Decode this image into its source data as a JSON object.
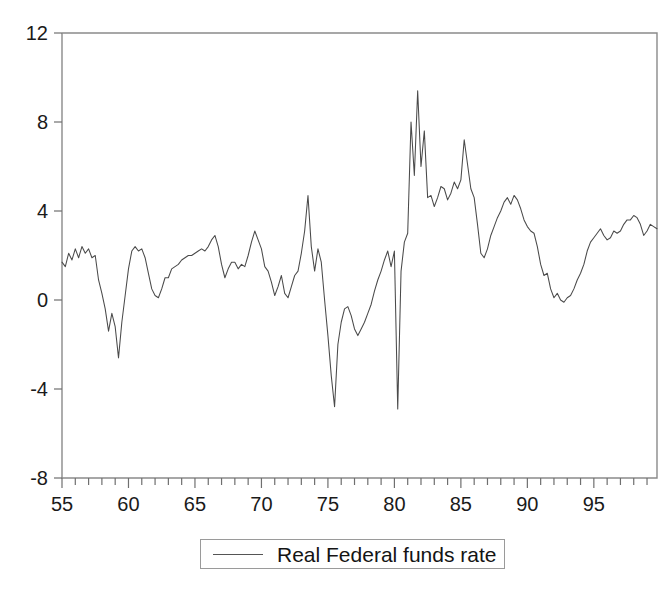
{
  "figure": {
    "background": "#ffffff",
    "line_color": "#4a4a4a",
    "axis_color": "#8a8a8a"
  },
  "legend": {
    "label": "Real Federal funds rate",
    "swatch_name": "line-swatch",
    "position": "bottom-center",
    "border_color": "#9a9a9a"
  },
  "axes": {
    "y_ticks": [
      "12",
      "8",
      "4",
      "0",
      "-4",
      "-8"
    ],
    "y_tick_values": [
      12,
      8,
      4,
      0,
      -4,
      -8
    ],
    "x_ticks": [
      "55",
      "60",
      "65",
      "70",
      "75",
      "80",
      "85",
      "90",
      "95"
    ],
    "x_tick_values": [
      55,
      60,
      65,
      70,
      75,
      80,
      85,
      90,
      95
    ],
    "x_minor_step": 1,
    "grid": false
  },
  "chart_data": {
    "type": "line",
    "title": "",
    "subtitle": "",
    "xlabel": "",
    "ylabel": "",
    "xlim": [
      1955.0,
      1999.75
    ],
    "ylim": [
      -8,
      12
    ],
    "grid": false,
    "legend_position": "bottom-center",
    "series": [
      {
        "name": "Real Federal funds rate",
        "color": "#4a4a4a",
        "x": [
          1955.0,
          1955.25,
          1955.5,
          1955.75,
          1956.0,
          1956.25,
          1956.5,
          1956.75,
          1957.0,
          1957.25,
          1957.5,
          1957.75,
          1958.0,
          1958.25,
          1958.5,
          1958.75,
          1959.0,
          1959.25,
          1959.5,
          1959.75,
          1960.0,
          1960.25,
          1960.5,
          1960.75,
          1961.0,
          1961.25,
          1961.5,
          1961.75,
          1962.0,
          1962.25,
          1962.5,
          1962.75,
          1963.0,
          1963.25,
          1963.5,
          1963.75,
          1964.0,
          1964.25,
          1964.5,
          1964.75,
          1965.0,
          1965.25,
          1965.5,
          1965.75,
          1966.0,
          1966.25,
          1966.5,
          1966.75,
          1967.0,
          1967.25,
          1967.5,
          1967.75,
          1968.0,
          1968.25,
          1968.5,
          1968.75,
          1969.0,
          1969.25,
          1969.5,
          1969.75,
          1970.0,
          1970.25,
          1970.5,
          1970.75,
          1971.0,
          1971.25,
          1971.5,
          1971.75,
          1972.0,
          1972.25,
          1972.5,
          1972.75,
          1973.0,
          1973.25,
          1973.5,
          1973.75,
          1974.0,
          1974.25,
          1974.5,
          1974.75,
          1975.0,
          1975.25,
          1975.5,
          1975.75,
          1976.0,
          1976.25,
          1976.5,
          1976.75,
          1977.0,
          1977.25,
          1977.5,
          1977.75,
          1978.0,
          1978.25,
          1978.5,
          1978.75,
          1979.0,
          1979.25,
          1979.5,
          1979.75,
          1980.0,
          1980.25,
          1980.5,
          1980.75,
          1981.0,
          1981.25,
          1981.5,
          1981.75,
          1982.0,
          1982.25,
          1982.5,
          1982.75,
          1983.0,
          1983.25,
          1983.5,
          1983.75,
          1984.0,
          1984.25,
          1984.5,
          1984.75,
          1985.0,
          1985.25,
          1985.5,
          1985.75,
          1986.0,
          1986.25,
          1986.5,
          1986.75,
          1987.0,
          1987.25,
          1987.5,
          1987.75,
          1988.0,
          1988.25,
          1988.5,
          1988.75,
          1989.0,
          1989.25,
          1989.5,
          1989.75,
          1990.0,
          1990.25,
          1990.5,
          1990.75,
          1991.0,
          1991.25,
          1991.5,
          1991.75,
          1992.0,
          1992.25,
          1992.5,
          1992.75,
          1993.0,
          1993.25,
          1993.5,
          1993.75,
          1994.0,
          1994.25,
          1994.5,
          1994.75,
          1995.0,
          1995.25,
          1995.5,
          1995.75,
          1996.0,
          1996.25,
          1996.5,
          1996.75,
          1997.0,
          1997.25,
          1997.5,
          1997.75,
          1998.0,
          1998.25,
          1998.5,
          1998.75,
          1999.0,
          1999.25,
          1999.5,
          1999.75
        ],
        "y": [
          1.7,
          1.5,
          2.1,
          1.8,
          2.3,
          1.9,
          2.4,
          2.1,
          2.3,
          1.9,
          2.0,
          0.9,
          0.3,
          -0.4,
          -1.4,
          -0.6,
          -1.2,
          -2.6,
          -1.0,
          0.2,
          1.4,
          2.2,
          2.4,
          2.2,
          2.3,
          1.9,
          1.2,
          0.5,
          0.2,
          0.1,
          0.5,
          1.0,
          1.0,
          1.4,
          1.5,
          1.6,
          1.8,
          1.9,
          2.0,
          2.0,
          2.1,
          2.2,
          2.3,
          2.2,
          2.4,
          2.7,
          2.9,
          2.4,
          1.6,
          1.0,
          1.4,
          1.7,
          1.7,
          1.4,
          1.6,
          1.5,
          2.0,
          2.6,
          3.1,
          2.7,
          2.3,
          1.5,
          1.3,
          0.8,
          0.2,
          0.6,
          1.1,
          0.3,
          0.1,
          0.6,
          1.1,
          1.3,
          2.1,
          3.1,
          4.7,
          2.4,
          1.3,
          2.3,
          1.7,
          0.0,
          -1.6,
          -3.4,
          -4.8,
          -2.0,
          -1.0,
          -0.4,
          -0.3,
          -0.7,
          -1.3,
          -1.6,
          -1.3,
          -1.0,
          -0.6,
          -0.2,
          0.4,
          0.9,
          1.3,
          1.8,
          2.2,
          1.5,
          2.2,
          -4.9,
          1.3,
          2.6,
          3.0,
          8.0,
          5.6,
          9.4,
          6.0,
          7.6,
          4.6,
          4.7,
          4.2,
          4.6,
          5.1,
          5.0,
          4.5,
          4.8,
          5.3,
          5.0,
          5.4,
          7.2,
          6.1,
          5.0,
          4.6,
          3.4,
          2.1,
          1.9,
          2.3,
          2.9,
          3.3,
          3.7,
          4.0,
          4.4,
          4.6,
          4.3,
          4.7,
          4.5,
          4.1,
          3.6,
          3.3,
          3.1,
          3.0,
          2.4,
          1.6,
          1.1,
          1.2,
          0.5,
          0.1,
          0.3,
          0.0,
          -0.1,
          0.1,
          0.2,
          0.5,
          0.9,
          1.2,
          1.6,
          2.2,
          2.6,
          2.8,
          3.0,
          3.2,
          2.9,
          2.7,
          2.8,
          3.1,
          3.0,
          3.1,
          3.4,
          3.6,
          3.6,
          3.8,
          3.7,
          3.4,
          2.9,
          3.1,
          3.4,
          3.3,
          3.2
        ]
      }
    ]
  }
}
